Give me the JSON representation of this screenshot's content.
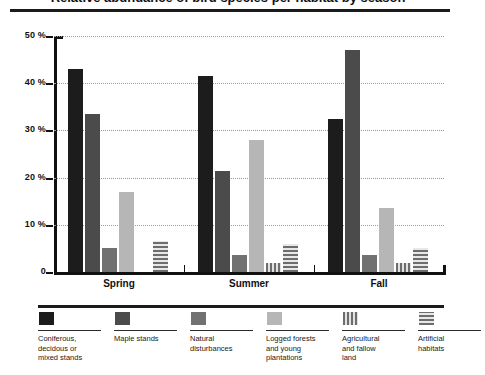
{
  "title": "Relative abundance of bird species per habitat by season",
  "chart_data": {
    "type": "bar",
    "title": "Relative abundance of bird species per habitat by season",
    "xlabel": "",
    "ylabel": "",
    "ylim": [
      0,
      50
    ],
    "yticks": [
      0,
      10,
      20,
      30,
      40,
      50
    ],
    "ytick_labels": [
      "0",
      "10 %",
      "20 %",
      "30 %",
      "40 %",
      "50 %"
    ],
    "grid": true,
    "legend_position": "bottom",
    "categories": [
      "Spring",
      "Summer",
      "Fall"
    ],
    "series": [
      {
        "name": "Coniferous, decidous or mixed stands",
        "color": "#1c1c1c",
        "pattern": "solid",
        "values": [
          43.0,
          41.5,
          32.5
        ]
      },
      {
        "name": "Maple stands",
        "color": "#4b4b4b",
        "pattern": "solid",
        "values": [
          33.5,
          21.5,
          47.0
        ]
      },
      {
        "name": "Natural disturbances",
        "color": "#717171",
        "pattern": "solid",
        "values": [
          5.0,
          3.5,
          3.7
        ]
      },
      {
        "name": "Logged forests and young plantations",
        "color": "#b6b6b6",
        "pattern": "solid",
        "values": [
          17.0,
          28.0,
          13.5
        ]
      },
      {
        "name": "Agricultural and fallow land",
        "color": "#6d6d6d",
        "pattern": "vertical-stripes",
        "values": [
          0.0,
          2.0,
          2.0
        ]
      },
      {
        "name": "Artificial habitats",
        "color": "#6d6d6d",
        "pattern": "horizontal-stripes",
        "values": [
          6.5,
          6.0,
          5.0
        ]
      }
    ]
  },
  "legend": [
    {
      "label": "Coniferous,\ndecidous or\nmixed stands"
    },
    {
      "label": "Maple stands"
    },
    {
      "label": "Natural\ndisturbances"
    },
    {
      "label": "Logged forests\nand young\nplantations"
    },
    {
      "label": "Agricultural\nand fallow\nland"
    },
    {
      "label": "Artificial\nhabitats"
    }
  ]
}
